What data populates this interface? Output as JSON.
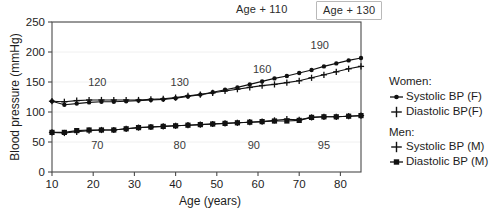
{
  "chart_data": {
    "type": "line",
    "title": "",
    "xlabel": "Age (years)",
    "ylabel": "Blood pressure (mmHg)",
    "xlim": [
      10,
      85
    ],
    "ylim": [
      0,
      250
    ],
    "xticks": [
      10,
      20,
      30,
      40,
      50,
      60,
      70,
      80
    ],
    "yticks": [
      0,
      50,
      100,
      150,
      200,
      250
    ],
    "grid": "horizontal-faint",
    "legend_position": "right",
    "x": [
      10,
      13,
      16,
      19,
      22,
      25,
      28,
      31,
      34,
      37,
      40,
      43,
      46,
      49,
      52,
      55,
      58,
      61,
      64,
      67,
      70,
      73,
      76,
      79,
      82,
      85
    ],
    "series": [
      {
        "name": "Systolic BP (F)",
        "group": "Women",
        "marker": "dot-line",
        "values": [
          118,
          112,
          114,
          116,
          117,
          117,
          118,
          119,
          120,
          121,
          123,
          126,
          129,
          133,
          137,
          141,
          146,
          151,
          156,
          160,
          165,
          170,
          176,
          181,
          186,
          190
        ]
      },
      {
        "name": "Diastolic BP(F)",
        "group": "Women",
        "marker": "plus",
        "values": [
          66,
          65,
          67,
          69,
          70,
          70,
          72,
          74,
          75,
          76,
          77,
          78,
          79,
          80,
          81,
          82,
          83,
          84,
          86,
          88,
          87,
          91,
          92,
          92,
          93,
          94
        ]
      },
      {
        "name": "Systolic BP (M)",
        "group": "Men",
        "marker": "plus",
        "values": [
          118,
          117,
          119,
          120,
          120,
          120,
          120,
          120,
          121,
          122,
          124,
          127,
          129,
          132,
          135,
          138,
          141,
          144,
          146,
          149,
          152,
          157,
          162,
          167,
          172,
          176
        ]
      },
      {
        "name": "Diastolic BP (M)",
        "group": "Men",
        "marker": "square",
        "values": [
          66,
          66,
          69,
          70,
          70,
          70,
          72,
          74,
          75,
          76,
          77,
          78,
          79,
          80,
          81,
          82,
          83,
          84,
          85,
          85,
          86,
          91,
          92,
          92,
          93,
          94
        ]
      }
    ],
    "annotations": [
      {
        "text": "120",
        "x": 21,
        "y": 143
      },
      {
        "text": "130",
        "x": 41,
        "y": 143
      },
      {
        "text": "160",
        "x": 61,
        "y": 165
      },
      {
        "text": "190",
        "x": 75,
        "y": 205
      },
      {
        "text": "70",
        "x": 21,
        "y": 38
      },
      {
        "text": "80",
        "x": 41,
        "y": 38
      },
      {
        "text": "90",
        "x": 59,
        "y": 38
      },
      {
        "text": "95",
        "x": 76,
        "y": 38
      }
    ]
  },
  "callouts": {
    "age_plus_110": "Age + 110",
    "age_plus_130": "Age + 130"
  },
  "legend": {
    "groups": [
      {
        "title": "Women:",
        "entries": [
          {
            "label": "Systolic BP (F)",
            "marker": "dot-line"
          },
          {
            "label": "Diastolic BP(F)",
            "marker": "plus"
          }
        ]
      },
      {
        "title": "Men:",
        "entries": [
          {
            "label": "Systolic BP (M)",
            "marker": "plus"
          },
          {
            "label": "Diastolic BP (M)",
            "marker": "square"
          }
        ]
      }
    ]
  },
  "colors": {
    "line": "#111111",
    "frame": "#4a4a4a",
    "grid": "#f0f0f0",
    "text": "#1d1d1d",
    "background": "#ffffff",
    "callout_border": "#b9b9b9"
  }
}
